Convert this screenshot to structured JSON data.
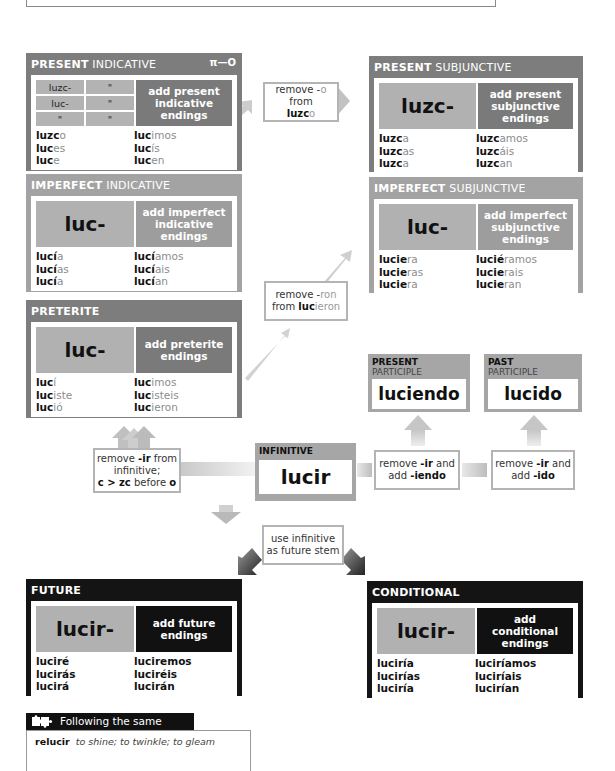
{
  "verb": "lucir",
  "colors": {
    "dark_panel": "#7d7d7d",
    "mid_panel": "#a3a3a3",
    "black_panel": "#141414",
    "stem_cell": "#b1b1b1",
    "ending_gray": "#8c8c8c"
  },
  "present_indicative": {
    "title_bold": "PRESENT",
    "title_light": "INDICATIVE",
    "key_icon": "key-icon",
    "key_glyph": "π—O",
    "grid": [
      [
        "luzc-",
        "\""
      ],
      [
        "luc-",
        "\""
      ],
      [
        "\"",
        "\""
      ]
    ],
    "note": "add present indicative endings",
    "forms_left": [
      {
        "stem": "luzc",
        "end": "o"
      },
      {
        "stem": "luc",
        "end": "es"
      },
      {
        "stem": "luc",
        "end": "e"
      }
    ],
    "forms_right": [
      {
        "stem": "luc",
        "end": "imos"
      },
      {
        "stem": "luc",
        "end": "ís"
      },
      {
        "stem": "luc",
        "end": "en"
      }
    ]
  },
  "imperfect_indicative": {
    "title_bold": "IMPERFECT",
    "title_light": "INDICATIVE",
    "stem": "luc-",
    "note": "add imperfect indicative endings",
    "forms_left": [
      {
        "stem": "lucí",
        "end": "a"
      },
      {
        "stem": "lucí",
        "end": "as"
      },
      {
        "stem": "lucí",
        "end": "a"
      }
    ],
    "forms_right": [
      {
        "stem": "lucí",
        "end": "amos"
      },
      {
        "stem": "lucí",
        "end": "ais"
      },
      {
        "stem": "lucí",
        "end": "an"
      }
    ]
  },
  "preterite": {
    "title_bold": "PRETERITE",
    "stem": "luc-",
    "note": "add preterite endings",
    "forms_left": [
      {
        "stem": "luc",
        "end": "í"
      },
      {
        "stem": "luc",
        "end": "iste"
      },
      {
        "stem": "luc",
        "end": "ió"
      }
    ],
    "forms_right": [
      {
        "stem": "luc",
        "end": "imos"
      },
      {
        "stem": "luc",
        "end": "isteis"
      },
      {
        "stem": "luc",
        "end": "ieron"
      }
    ]
  },
  "present_subjunctive": {
    "title_bold": "PRESENT",
    "title_light": "SUBJUNCTIVE",
    "stem": "luzc-",
    "note": "add present subjunctive endings",
    "forms_left": [
      {
        "stem": "luzc",
        "end": "a"
      },
      {
        "stem": "luzc",
        "end": "as"
      },
      {
        "stem": "luzc",
        "end": "a"
      }
    ],
    "forms_right": [
      {
        "stem": "luzc",
        "end": "amos"
      },
      {
        "stem": "luzc",
        "end": "áis"
      },
      {
        "stem": "luzc",
        "end": "an"
      }
    ]
  },
  "imperfect_subjunctive": {
    "title_bold": "IMPERFECT",
    "title_light": "SUBJUNCTIVE",
    "stem": "luc-",
    "note": "add imperfect subjunctive endings",
    "forms_left": [
      {
        "stem": "lucie",
        "end": "ra"
      },
      {
        "stem": "lucie",
        "end": "ras"
      },
      {
        "stem": "lucie",
        "end": "ra"
      }
    ],
    "forms_right": [
      {
        "stem": "lucié",
        "end": "ramos"
      },
      {
        "stem": "lucie",
        "end": "rais"
      },
      {
        "stem": "lucie",
        "end": "ran"
      }
    ]
  },
  "rules": {
    "remove_o": {
      "line1": "remove -",
      "line1_g": "o",
      "line1_b": " from",
      "line2_b": "luzc",
      "line2_g": "o"
    },
    "remove_ron": {
      "line1": "remove -",
      "line1_g": "ron",
      "line2": "from ",
      "line2_b": "luc",
      "line2_g": "ieron"
    },
    "remove_ir_zc": {
      "line1a": "remove ",
      "line1b": "-ir",
      "line1c": " from",
      "line2": "infinitive;",
      "line3a": "c > zc",
      "line3b": " before ",
      "line3c": "o"
    },
    "remove_ir_iendo": {
      "line1a": "remove ",
      "line1b": "-ir",
      "line1c": " and",
      "line2a": "add ",
      "line2b": "-iendo"
    },
    "remove_ir_ido": {
      "line1a": "remove ",
      "line1b": "-ir",
      "line1c": " and",
      "line2a": "add ",
      "line2b": "-ido"
    },
    "future_stem": {
      "line1": "use infinitive",
      "line2": "as future stem"
    }
  },
  "present_participle": {
    "label_bold": "PRESENT",
    "label": "PARTICIPLE",
    "word": "luciendo"
  },
  "past_participle": {
    "label_bold": "PAST",
    "label": "PARTICIPLE",
    "word": "lucido"
  },
  "infinitive": {
    "label": "INFINITIVE",
    "word": "lucir"
  },
  "future": {
    "title_bold": "FUTURE",
    "stem": "lucir-",
    "note": "add future endings",
    "forms_left": [
      "luciré",
      "lucirás",
      "lucirá"
    ],
    "forms_right": [
      "luciremos",
      "luciréis",
      "lucirán"
    ]
  },
  "conditional": {
    "title_bold": "CONDITIONAL",
    "stem": "lucir-",
    "note": "add conditional endings",
    "forms_left": [
      "luciría",
      "lucirías",
      "luciría"
    ],
    "forms_right": [
      "luciríamos",
      "luciríais",
      "lucirían"
    ]
  },
  "following": {
    "icon": "puzzle-icon",
    "title": "Following the same pattern",
    "verb": "relucir",
    "meaning": "to shine; to twinkle; to gleam"
  }
}
